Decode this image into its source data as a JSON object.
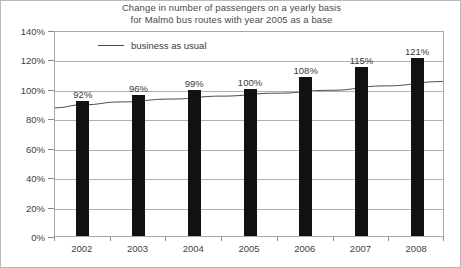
{
  "chart_data": {
    "type": "bar",
    "title": "Change in number of passengers on a yearly basis for Malmö bus routes with year 2005 as a base",
    "title_lines": [
      "Change in number of passengers on a yearly basis",
      "for Malmö bus routes with year 2005 as a base"
    ],
    "categories": [
      "2002",
      "2003",
      "2004",
      "2005",
      "2006",
      "2007",
      "2008"
    ],
    "values": [
      92,
      96,
      99,
      100,
      108,
      115,
      121
    ],
    "value_labels": [
      "92%",
      "96%",
      "99%",
      "100%",
      "108%",
      "115%",
      "121%"
    ],
    "xlabel": "",
    "ylabel": "",
    "ylim": [
      0,
      140
    ],
    "ytick_values": [
      0,
      20,
      40,
      60,
      80,
      100,
      120,
      140
    ],
    "ytick_labels": [
      "0%",
      "20%",
      "40%",
      "60%",
      "80%",
      "100%",
      "120%",
      "140%"
    ],
    "grid": "horizontal",
    "legend_position": "top-left-inside",
    "series": [
      {
        "name": "passengers",
        "type": "bar",
        "color": "#111111",
        "values": [
          92,
          96,
          99,
          100,
          108,
          115,
          121
        ]
      },
      {
        "name": "business as usual",
        "type": "line",
        "color": "#4a4a4a",
        "description": "smooth rising trend curve across the plot",
        "endpoint_values": [
          88,
          106
        ],
        "points": [
          {
            "x": 0,
            "y": 88
          },
          {
            "x": 0.07,
            "y": 90
          },
          {
            "x": 0.17,
            "y": 92
          },
          {
            "x": 0.3,
            "y": 94
          },
          {
            "x": 0.43,
            "y": 96
          },
          {
            "x": 0.57,
            "y": 98
          },
          {
            "x": 0.71,
            "y": 100
          },
          {
            "x": 0.85,
            "y": 103
          },
          {
            "x": 1,
            "y": 106
          }
        ]
      }
    ]
  },
  "legend": {
    "items": [
      {
        "label": "business as usual",
        "marker": "line",
        "color": "#4a4a4a"
      }
    ]
  },
  "colors": {
    "bar": "#111111",
    "trend_line": "#4a4a4a",
    "gridline": "#b0b0b0",
    "plot_border": "#a8a8a8",
    "figure_border": "#b9b9b9",
    "text": "#3a3a3a",
    "background": "#ffffff"
  }
}
